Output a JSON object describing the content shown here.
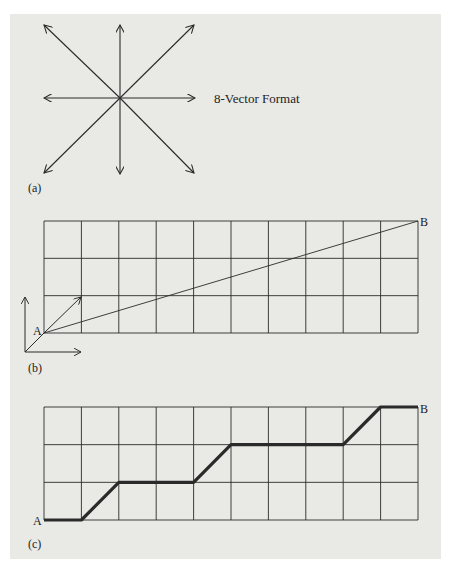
{
  "figure": {
    "panel_a": {
      "label": "(a)",
      "caption": "8-Vector Format",
      "directions": [
        "N",
        "NE",
        "E",
        "SE",
        "S",
        "SW",
        "W",
        "NW"
      ]
    },
    "panel_b": {
      "label": "(b)",
      "grid": {
        "columns": 10,
        "rows": 3
      },
      "start_label": "A",
      "end_label": "B",
      "description": "Straight line from A to B with 8-vector axes at lower-left"
    },
    "panel_c": {
      "label": "(c)",
      "grid": {
        "columns": 10,
        "rows": 3
      },
      "start_label": "A",
      "end_label": "B",
      "path_points": [
        [
          0,
          0
        ],
        [
          1,
          0
        ],
        [
          2,
          1
        ],
        [
          4,
          1
        ],
        [
          5,
          2
        ],
        [
          8,
          2
        ],
        [
          9,
          3
        ],
        [
          10,
          3
        ]
      ]
    }
  },
  "colors": {
    "background": "#e9e9e6",
    "ink": "#2a2a2a"
  }
}
